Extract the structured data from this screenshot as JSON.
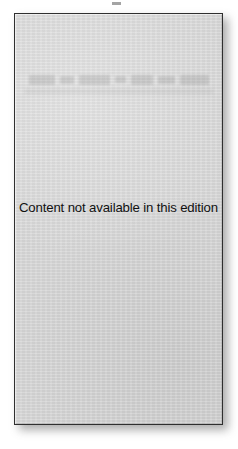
{
  "page": {
    "background_color": "#ffffff",
    "artifact_name": "top-edge-scan-speck"
  },
  "placeholder": {
    "message": "Content not available in this edition",
    "fill_color": "#d4d4d4",
    "border_color": "#2f2f2f",
    "shadow_color": "#3c3c3c",
    "watermark_legible": false
  }
}
